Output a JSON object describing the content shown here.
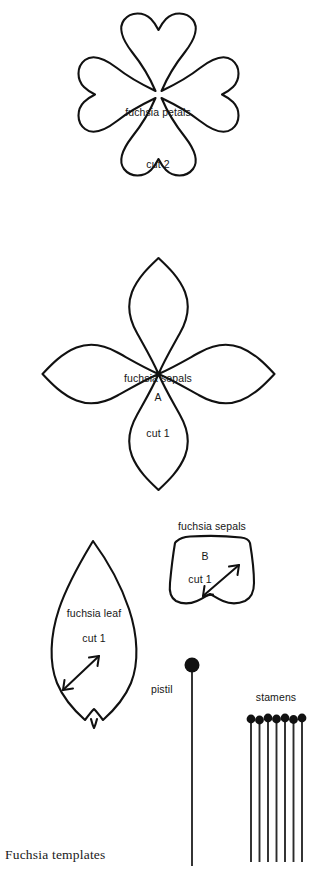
{
  "page": {
    "background_color": "#ffffff",
    "ink_color": "#111111",
    "width": 322,
    "height": 880,
    "caption": "Fuchsia templates"
  },
  "templates": [
    {
      "id": "fuchsia-petals",
      "name": "fuchsia petals",
      "title": "fuchsia petals",
      "quantity_label": "cut 2",
      "letter": "",
      "shape": "four-lobed-clover",
      "has_grain_arrow": false
    },
    {
      "id": "fuchsia-sepals-a",
      "name": "fuchsia sepals A",
      "title": "fuchsia sepals",
      "letter": "A",
      "quantity_label": "cut 1",
      "shape": "four-pointed-petal-cross",
      "has_grain_arrow": false
    },
    {
      "id": "fuchsia-leaf",
      "name": "fuchsia leaf",
      "title": "fuchsia leaf",
      "letter": "",
      "quantity_label": "cut 1",
      "shape": "pointed-leaf",
      "has_grain_arrow": true
    },
    {
      "id": "fuchsia-sepals-b",
      "name": "fuchsia sepals B",
      "title": "fuchsia sepals",
      "letter": "B",
      "quantity_label": "cut 1",
      "shape": "notched-trapezoid",
      "has_grain_arrow": true
    }
  ],
  "parts": {
    "pistil": {
      "label": "pistil",
      "count": 1,
      "head_shape": "round",
      "head_color": "#111111"
    },
    "stamens": {
      "label": "stamens",
      "count": 7,
      "head_shape": "round",
      "head_color": "#111111"
    }
  }
}
